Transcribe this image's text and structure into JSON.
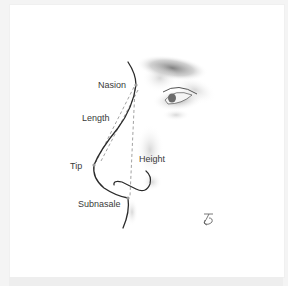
{
  "figure": {
    "labels": {
      "nasion": "Nasion",
      "length": "Length",
      "tip": "Tip",
      "height": "Height",
      "subnasale": "Subnasale"
    },
    "signature": "ƒ̥",
    "colors": {
      "line": "#2a2a2a",
      "dashed": "#8a8a8a",
      "marker": "#9a9a9a",
      "text": "#3a3a3a",
      "background": "#ffffff",
      "frame": "#f4f4f4"
    },
    "points": {
      "nasion": [
        136,
        85
      ],
      "tip": [
        94,
        165
      ],
      "subnasale": [
        128,
        198
      ]
    }
  }
}
